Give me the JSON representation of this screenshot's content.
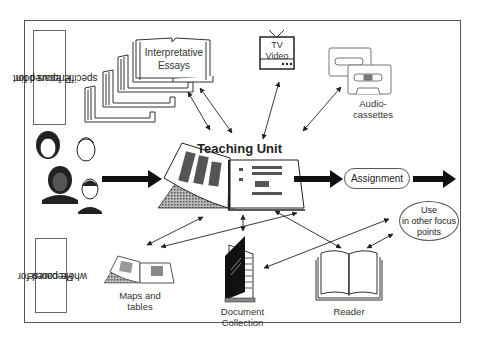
{
  "side_labels": {
    "top_line1": "Prepared for",
    "top_line2": "specific focus point",
    "bottom_line1": "Prepared for",
    "bottom_line2": "whole course"
  },
  "nodes": {
    "essays": {
      "line1": "Interpretative",
      "line2": "Essays"
    },
    "tv": {
      "line1": "TV",
      "line2": "Video"
    },
    "audio": {
      "line1": "Audio-",
      "line2": "cassettes"
    },
    "teaching_unit": {
      "label": "Teaching Unit"
    },
    "assignment": {
      "label": "Assignment"
    },
    "use_other": {
      "line1": "Use",
      "line2": "in other focus",
      "line3": "points"
    },
    "maps": {
      "line1": "Maps and",
      "line2": "tables"
    },
    "documents": {
      "line1": "Document",
      "line2": "Collection"
    },
    "reader": {
      "label": "Reader"
    }
  },
  "colors": {
    "stroke": "#333333",
    "frame": "#555555",
    "hatch": "#888888",
    "fill_dark": "#1a1a1a"
  }
}
